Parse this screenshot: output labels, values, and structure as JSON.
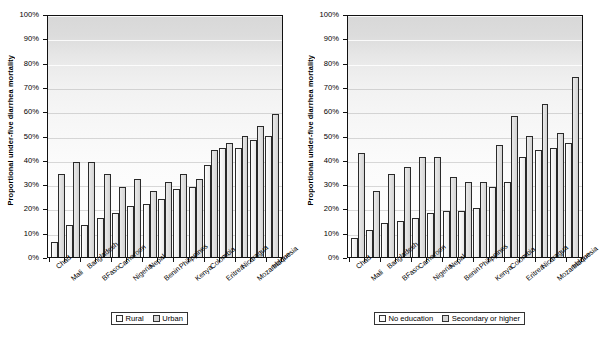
{
  "figure": {
    "panels": [
      "left",
      "right"
    ]
  },
  "chart_data": [
    {
      "type": "bar",
      "panel": "left",
      "title": "",
      "xlabel": "",
      "ylabel": "Proportional under-five diarrhea mortality",
      "ylim": [
        0,
        100
      ],
      "ytick_labels": [
        "100%",
        "90%",
        "80%",
        "70%",
        "60%",
        "50%",
        "40%",
        "30%",
        "20%",
        "10%",
        "0%"
      ],
      "ytick_values": [
        100,
        90,
        80,
        70,
        60,
        50,
        40,
        30,
        20,
        10,
        0
      ],
      "grid": true,
      "legend_position": "bottom",
      "categories": [
        "Chad",
        "Mali",
        "Bangladesh",
        "BFaso",
        "Cameroon",
        "Nigeria",
        "Nepal",
        "Benin",
        "Philippines",
        "Kenya",
        "Colombia",
        "Eritrea",
        "Nicaragua",
        "Mozambique",
        "Indonesia"
      ],
      "series": [
        {
          "name": "Rural",
          "values": [
            6,
            13,
            13,
            16,
            18,
            21,
            22,
            24,
            28,
            29,
            38,
            45,
            45,
            48,
            50
          ]
        },
        {
          "name": "Urban",
          "values": [
            34,
            39,
            39,
            34,
            29,
            32,
            27,
            31,
            34,
            32,
            44,
            47,
            50,
            54,
            59
          ]
        }
      ]
    },
    {
      "type": "bar",
      "panel": "right",
      "title": "",
      "xlabel": "",
      "ylabel": "Proportional under-five diarrhea mortality",
      "ylim": [
        0,
        100
      ],
      "ytick_labels": [
        "100%",
        "90%",
        "80%",
        "70%",
        "60%",
        "50%",
        "40%",
        "30%",
        "20%",
        "10%",
        "0%"
      ],
      "ytick_values": [
        100,
        90,
        80,
        70,
        60,
        50,
        40,
        30,
        20,
        10,
        0
      ],
      "grid": true,
      "legend_position": "bottom",
      "categories": [
        "Chad",
        "Mali",
        "Bangladesh",
        "BFaso",
        "Cameroon",
        "Nigeria",
        "Nepal",
        "Benin",
        "Philippines",
        "Kenya",
        "Colombia",
        "Eritrea",
        "Nicaragua",
        "Mozambique",
        "Indonesia"
      ],
      "series": [
        {
          "name": "No education",
          "values": [
            8,
            11,
            14,
            15,
            16,
            18,
            19,
            19,
            20,
            29,
            31,
            41,
            44,
            45,
            47
          ]
        },
        {
          "name": "Secondary or higher",
          "values": [
            43,
            27,
            34,
            37,
            41,
            41,
            33,
            31,
            31,
            46,
            58,
            50,
            63,
            51,
            74
          ]
        }
      ]
    }
  ]
}
